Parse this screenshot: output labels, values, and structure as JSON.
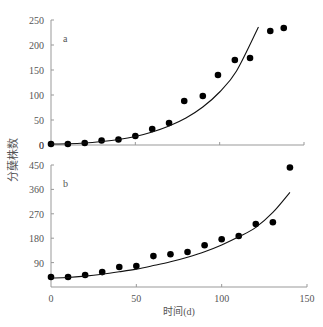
{
  "figure": {
    "ylabel": "分蘖株数",
    "xlabel": "时间(d)",
    "x_ticks": [
      0,
      50,
      100,
      150
    ]
  },
  "chart_data": [
    {
      "type": "scatter",
      "panel_label": "a",
      "title": "",
      "xlabel": "时间(d)",
      "ylabel": "分蘖株数",
      "xlim": [
        0,
        150
      ],
      "ylim": [
        0,
        250
      ],
      "x_ticks": [
        0,
        50,
        100,
        150
      ],
      "y_ticks": [
        0,
        50,
        100,
        150,
        200,
        250
      ],
      "grid": false,
      "series": [
        {
          "name": "observed",
          "marker": "filled-circle",
          "x": [
            0,
            10,
            20,
            30,
            40,
            50,
            60,
            70,
            79,
            90,
            99,
            109,
            118,
            130,
            138
          ],
          "y": [
            2,
            2,
            4,
            9,
            11,
            18,
            32,
            44,
            88,
            98,
            140,
            170,
            174,
            228,
            234
          ]
        },
        {
          "name": "fitted",
          "style": "line",
          "x": [
            0,
            10,
            20,
            30,
            40,
            50,
            60,
            70,
            80,
            90,
            100,
            110,
            123
          ],
          "y": [
            2,
            2.5,
            4,
            7,
            11,
            17,
            26,
            38,
            54,
            76,
            106,
            148,
            236
          ]
        }
      ]
    },
    {
      "type": "scatter",
      "panel_label": "b",
      "title": "",
      "xlabel": "时间(d)",
      "ylabel": "分蘖株数",
      "xlim": [
        0,
        150
      ],
      "ylim": [
        0,
        450
      ],
      "x_ticks": [
        0,
        50,
        100,
        150
      ],
      "y_ticks": [
        90,
        180,
        270,
        360,
        450
      ],
      "grid": false,
      "series": [
        {
          "name": "observed",
          "marker": "filled-circle",
          "x": [
            0,
            10,
            20,
            30,
            40,
            50,
            60,
            70,
            80,
            90,
            100,
            110,
            120,
            130,
            140
          ],
          "y": [
            37,
            37,
            44,
            55,
            74,
            77,
            114,
            121,
            129,
            154,
            176,
            188,
            232,
            239,
            441
          ]
        },
        {
          "name": "fitted",
          "style": "line",
          "x": [
            0,
            10,
            20,
            30,
            40,
            50,
            60,
            70,
            80,
            90,
            100,
            110,
            120,
            130,
            140
          ],
          "y": [
            33,
            35,
            40,
            47,
            56,
            66,
            79,
            93,
            110,
            130,
            155,
            185,
            220,
            275,
            349
          ]
        }
      ]
    }
  ]
}
